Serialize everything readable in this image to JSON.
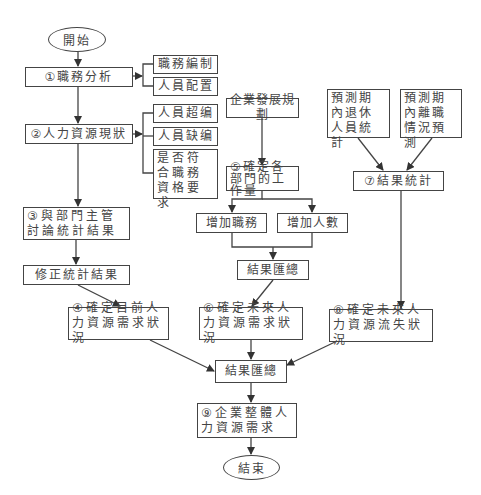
{
  "diagram": {
    "type": "flowchart",
    "start": "開始",
    "end": "結束",
    "nodes": {
      "n1": "①職務分析",
      "n1a": "職務編制",
      "n1b": "人員配置",
      "n2": "②人力資源現狀",
      "n2a": "人員超编",
      "n2b": "人員缺编",
      "n2c": "是否符合職務資格要求",
      "n3": "③與部門主管討論統計結果",
      "n3a": "修正統計結果",
      "n4": "④確定目前人力資源需求狀況",
      "plan": "企業發展規劃",
      "n5": "⑤確定各部門的工作量",
      "n5a": "增加職務",
      "n5b": "增加人數",
      "n5sum": "結果匯總",
      "n6": "⑥確定未來人力資源需求狀況",
      "retire": "預測期內退休人員統計",
      "leave": "預測期內離職情況預測",
      "n7": "⑦結果統計",
      "n8": "⑧確定未來人力資源流失狀況",
      "sum": "結果匯總",
      "n9": "⑨企業整體人力資源需求"
    },
    "edges": [
      [
        "start",
        "n1"
      ],
      [
        "n1",
        "n1a"
      ],
      [
        "n1",
        "n1b"
      ],
      [
        "n1",
        "n2"
      ],
      [
        "n2",
        "n2a"
      ],
      [
        "n2",
        "n2b"
      ],
      [
        "n2",
        "n2c"
      ],
      [
        "n2",
        "n3"
      ],
      [
        "n3",
        "n3a"
      ],
      [
        "n3a",
        "n4"
      ],
      [
        "plan",
        "n5"
      ],
      [
        "n5",
        "n5a"
      ],
      [
        "n5",
        "n5b"
      ],
      [
        "n5a",
        "n5sum"
      ],
      [
        "n5b",
        "n5sum"
      ],
      [
        "n5sum",
        "n6"
      ],
      [
        "retire",
        "n7"
      ],
      [
        "leave",
        "n7"
      ],
      [
        "n7",
        "n8"
      ],
      [
        "n4",
        "sum"
      ],
      [
        "n6",
        "sum"
      ],
      [
        "n8",
        "sum"
      ],
      [
        "sum",
        "n9"
      ],
      [
        "n9",
        "end"
      ]
    ],
    "colors": {
      "line": "#444444",
      "text": "#444444",
      "background": "#ffffff"
    }
  }
}
